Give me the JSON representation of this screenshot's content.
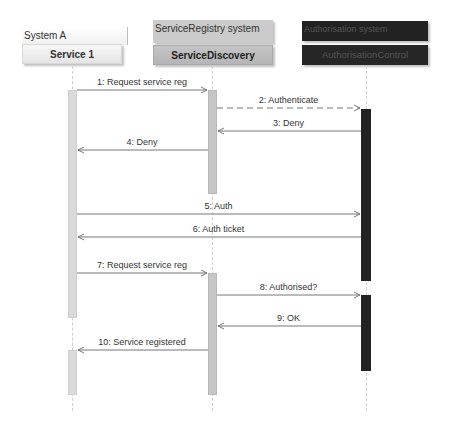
{
  "diagram": {
    "type": "sequence",
    "participants": [
      {
        "id": "service1",
        "system": "System A",
        "name": "Service 1",
        "system_color": "#f2f2f2",
        "object_color": "#ededed",
        "text_color": "#333333",
        "bar_color": "#d9d9d9"
      },
      {
        "id": "servicediscovery",
        "system": "ServiceRegistry system",
        "name": "ServiceDiscovery",
        "system_color": "#c8c8c8",
        "object_color": "#bdbdbd",
        "text_color": "#222222",
        "bar_color": "#c4c4c4"
      },
      {
        "id": "authcontrol",
        "system": "Authorisation system",
        "name": "AuthorisationControl",
        "system_color": "#222222",
        "object_color": "#262626",
        "text_color": "#555555",
        "bar_color": "#222222"
      }
    ],
    "messages": [
      {
        "n": 1,
        "label": "1: Request service reg",
        "from": "service1",
        "to": "servicediscovery",
        "style": "solid"
      },
      {
        "n": 2,
        "label": "2: Authenticate",
        "from": "servicediscovery",
        "to": "authcontrol",
        "style": "dashed"
      },
      {
        "n": 3,
        "label": "3: Deny",
        "from": "authcontrol",
        "to": "servicediscovery",
        "style": "solid"
      },
      {
        "n": 4,
        "label": "4: Deny",
        "from": "servicediscovery",
        "to": "service1",
        "style": "solid"
      },
      {
        "n": 5,
        "label": "5: Auth",
        "from": "service1",
        "to": "authcontrol",
        "style": "solid"
      },
      {
        "n": 6,
        "label": "6: Auth ticket",
        "from": "authcontrol",
        "to": "service1",
        "style": "solid"
      },
      {
        "n": 7,
        "label": "7: Request service reg",
        "from": "service1",
        "to": "servicediscovery",
        "style": "solid"
      },
      {
        "n": 8,
        "label": "8: Authorised?",
        "from": "servicediscovery",
        "to": "authcontrol",
        "style": "solid"
      },
      {
        "n": 9,
        "label": "9: OK",
        "from": "authcontrol",
        "to": "servicediscovery",
        "style": "solid"
      },
      {
        "n": 10,
        "label": "10: Service registered",
        "from": "servicediscovery",
        "to": "service1",
        "style": "solid"
      }
    ]
  }
}
